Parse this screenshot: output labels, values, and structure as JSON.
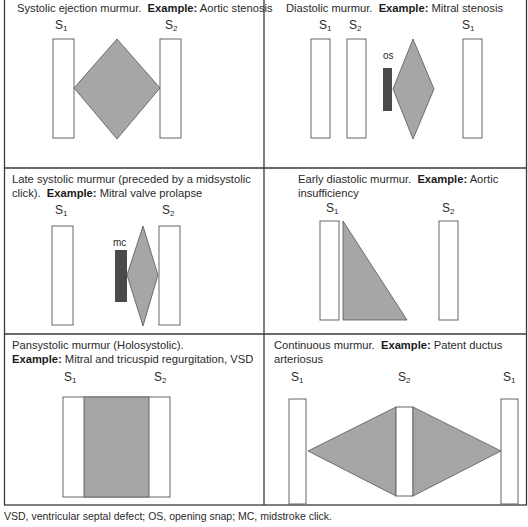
{
  "colors": {
    "border": "#3a3a3a",
    "murmur_fill": "#a6a6a6",
    "murmur_stroke": "#555555",
    "click_fill": "#4a4a4a",
    "sound_box_stroke": "#666666",
    "background": "#ffffff"
  },
  "panels": [
    {
      "id": "systolic-ejection",
      "title": "Systolic ejection murmur.",
      "example_label": "Example:",
      "example": "Aortic stenosis",
      "sounds": [
        "S1",
        "S2"
      ]
    },
    {
      "id": "diastolic",
      "title": "Diastolic murmur.",
      "example_label": "Example:",
      "example": "Mitral stenosis",
      "sounds": [
        "S1",
        "S2",
        "S1"
      ],
      "marker": "os"
    },
    {
      "id": "late-systolic",
      "title": "Late systolic murmur (preceded by a midsystolic click).",
      "title_line1": "Late systolic murmur (preceded by a midsystolic",
      "title_line2": "click).",
      "example_label": "Example:",
      "example": "Mitral valve prolapse",
      "sounds": [
        "S1",
        "S2"
      ],
      "marker": "mc"
    },
    {
      "id": "early-diastolic",
      "title_line1": "Early diastolic murmur.",
      "example_label": "Example:",
      "example_line1": "Aortic",
      "example_line2": "insufficiency",
      "sounds": [
        "S1",
        "S2"
      ]
    },
    {
      "id": "pansystolic",
      "title": "Pansystolic murmur (Holosystolic).",
      "example_label": "Example:",
      "example": "Mitral and tricuspid regurgitation, VSD",
      "sounds": [
        "S1",
        "S2"
      ]
    },
    {
      "id": "continuous",
      "title": "Continuous murmur.",
      "example_label": "Example:",
      "example_line1": "Patent ductus",
      "example_line2": "arteriosus",
      "sounds": [
        "S1",
        "S2",
        "S1"
      ]
    }
  ],
  "sound_labels": {
    "S": "S",
    "one": "1",
    "two": "2"
  },
  "caption": "VSD, ventricular septal defect; OS, opening snap; MC, midstroke click."
}
